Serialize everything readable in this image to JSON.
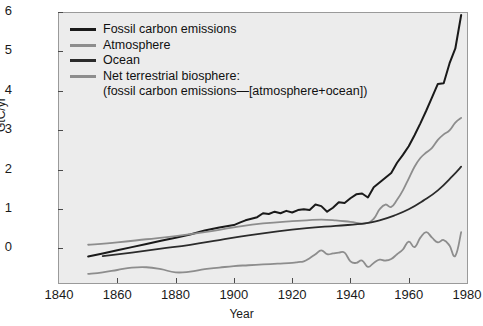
{
  "chart_data": {
    "type": "line",
    "title": "",
    "xlabel": "Year",
    "ylabel": "GtC/yr",
    "xlim": [
      1840,
      1980
    ],
    "ylim": [
      -0.85,
      6
    ],
    "xticks": [
      1840,
      1860,
      1880,
      1900,
      1920,
      1940,
      1960,
      1980
    ],
    "yticks": [
      0,
      1,
      2,
      3,
      4,
      5,
      6
    ],
    "grid": false,
    "legend_position": "top-left",
    "background": "#ececec",
    "series": [
      {
        "name": "Fossil carbon emissions",
        "color": "#1a1a1a",
        "x": [
          1850,
          1855,
          1860,
          1865,
          1870,
          1875,
          1880,
          1885,
          1890,
          1895,
          1900,
          1902,
          1904,
          1906,
          1908,
          1910,
          1912,
          1914,
          1916,
          1918,
          1920,
          1922,
          1924,
          1926,
          1928,
          1930,
          1932,
          1934,
          1936,
          1938,
          1940,
          1942,
          1944,
          1946,
          1948,
          1950,
          1952,
          1954,
          1956,
          1958,
          1960,
          1962,
          1964,
          1966,
          1968,
          1970,
          1972,
          1974,
          1976,
          1978
        ],
        "values": [
          -0.18,
          -0.1,
          -0.02,
          0.06,
          0.14,
          0.22,
          0.3,
          0.38,
          0.48,
          0.56,
          0.62,
          0.68,
          0.74,
          0.78,
          0.82,
          0.92,
          0.9,
          0.96,
          0.92,
          0.98,
          0.94,
          1.0,
          1.02,
          1.0,
          1.14,
          1.1,
          0.96,
          1.06,
          1.2,
          1.18,
          1.3,
          1.4,
          1.42,
          1.32,
          1.58,
          1.7,
          1.82,
          1.94,
          2.2,
          2.4,
          2.62,
          2.9,
          3.2,
          3.52,
          3.86,
          4.2,
          4.22,
          4.72,
          5.1,
          5.95
        ]
      },
      {
        "name": "Atmosphere",
        "color": "#8d8d8d",
        "x": [
          1850,
          1860,
          1870,
          1880,
          1890,
          1900,
          1910,
          1920,
          1925,
          1930,
          1935,
          1940,
          1945,
          1948,
          1950,
          1952,
          1954,
          1956,
          1958,
          1960,
          1962,
          1964,
          1966,
          1968,
          1970,
          1972,
          1974,
          1976,
          1978
        ],
        "values": [
          0.12,
          0.18,
          0.26,
          0.34,
          0.44,
          0.56,
          0.66,
          0.72,
          0.74,
          0.76,
          0.74,
          0.7,
          0.66,
          0.78,
          1.02,
          1.14,
          1.08,
          1.26,
          1.5,
          1.8,
          2.1,
          2.32,
          2.46,
          2.58,
          2.78,
          2.92,
          3.02,
          3.22,
          3.34
        ]
      },
      {
        "name": "Ocean",
        "color": "#2b2b2b",
        "x": [
          1855,
          1865,
          1875,
          1885,
          1895,
          1905,
          1915,
          1925,
          1935,
          1945,
          1950,
          1955,
          1960,
          1965,
          1970,
          1975,
          1978
        ],
        "values": [
          -0.17,
          -0.08,
          0.02,
          0.12,
          0.24,
          0.36,
          0.46,
          0.54,
          0.6,
          0.66,
          0.74,
          0.86,
          1.02,
          1.24,
          1.5,
          1.86,
          2.1
        ]
      },
      {
        "name": "Net terrestrial biosphere",
        "color": "#8d8d8d",
        "x": [
          1850,
          1855,
          1860,
          1865,
          1870,
          1875,
          1880,
          1885,
          1890,
          1895,
          1900,
          1905,
          1910,
          1915,
          1920,
          1922,
          1924,
          1926,
          1928,
          1930,
          1932,
          1934,
          1936,
          1938,
          1940,
          1942,
          1944,
          1946,
          1948,
          1950,
          1952,
          1954,
          1956,
          1958,
          1960,
          1962,
          1964,
          1966,
          1968,
          1970,
          1972,
          1974,
          1976,
          1978
        ],
        "values": [
          -0.62,
          -0.58,
          -0.52,
          -0.46,
          -0.45,
          -0.5,
          -0.58,
          -0.56,
          -0.5,
          -0.46,
          -0.42,
          -0.4,
          -0.38,
          -0.36,
          -0.34,
          -0.32,
          -0.3,
          -0.22,
          -0.12,
          -0.02,
          -0.12,
          -0.1,
          -0.08,
          -0.08,
          -0.3,
          -0.34,
          -0.28,
          -0.44,
          -0.34,
          -0.26,
          -0.28,
          -0.24,
          -0.12,
          0.0,
          0.2,
          0.06,
          0.3,
          0.44,
          0.3,
          0.18,
          0.24,
          0.1,
          -0.16,
          0.44
        ]
      }
    ],
    "legend": [
      {
        "label": "Fossil carbon emissions",
        "color": "#1a1a1a",
        "continuation": ""
      },
      {
        "label": "Atmosphere",
        "color": "#8d8d8d",
        "continuation": ""
      },
      {
        "label": "Ocean",
        "color": "#2b2b2b",
        "continuation": ""
      },
      {
        "label": "Net terrestrial biosphere:",
        "color": "#8d8d8d",
        "continuation": "(fossil carbon emissions—[atmosphere+ocean])"
      }
    ]
  }
}
